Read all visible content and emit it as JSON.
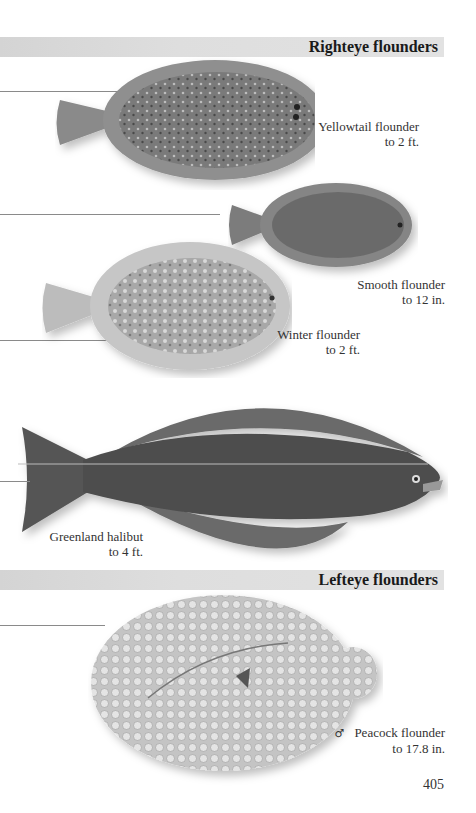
{
  "sections": [
    {
      "title": "Righteye flounders"
    },
    {
      "title": "Lefteye flounders"
    }
  ],
  "species": [
    {
      "name": "Yellowtail flounder",
      "size": "to 2 ft.",
      "sex_symbol": ""
    },
    {
      "name": "Smooth flounder",
      "size": "to 12 in.",
      "sex_symbol": ""
    },
    {
      "name": "Winter flounder",
      "size": "to 2 ft.",
      "sex_symbol": ""
    },
    {
      "name": "Greenland halibut",
      "size": "to 4 ft.",
      "sex_symbol": ""
    },
    {
      "name": "Peacock flounder",
      "size": "to 17.8 in.",
      "sex_symbol": "♂"
    }
  ],
  "page_number": "405",
  "colors": {
    "band": "#dcdcdc",
    "yellowtail_body": "#7a7a7a",
    "smooth_body": "#6e6e6e",
    "winter_body": "#a8a8a8",
    "halibut_body": "#4e4e4e",
    "peacock_body": "#cfcfcf"
  }
}
